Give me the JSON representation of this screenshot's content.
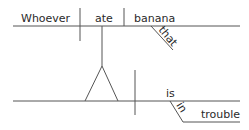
{
  "diagram": {
    "type": "sentence-diagram",
    "colors": {
      "line": "#555555",
      "text": "#2a2a2a",
      "background": "#ffffff"
    },
    "top_clause": {
      "subject": "Whoever",
      "verb": "ate",
      "object": "banana",
      "modifier": "that"
    },
    "main_clause": {
      "subject_placeholder": "noun-clause pedestal",
      "verb": "is",
      "preposition": "in",
      "prepositional_object": "trouble"
    }
  }
}
